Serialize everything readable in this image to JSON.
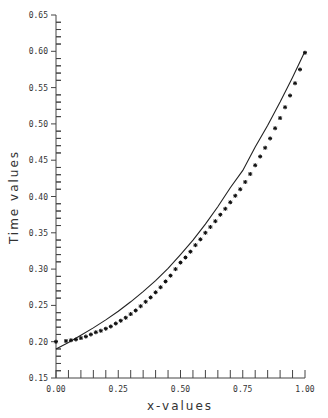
{
  "chart_data": {
    "type": "scatter",
    "title": "",
    "xlabel": "x-values",
    "ylabel": "Time values",
    "xlim": [
      0.0,
      1.0
    ],
    "ylim": [
      0.15,
      0.65
    ],
    "grid": false,
    "legend": null,
    "x_ticks": [
      "0.00",
      "0.25",
      "0.50",
      "0.75",
      "1.00"
    ],
    "y_ticks": [
      "0.15",
      "0.20",
      "0.25",
      "0.30",
      "0.35",
      "0.40",
      "0.45",
      "0.50",
      "0.55",
      "0.60",
      "0.65"
    ],
    "series": [
      {
        "name": "observed",
        "style": "markers",
        "marker": "asterisk",
        "x": [
          0.0,
          0.04,
          0.06,
          0.08,
          0.1,
          0.12,
          0.14,
          0.16,
          0.18,
          0.2,
          0.22,
          0.24,
          0.26,
          0.28,
          0.3,
          0.32,
          0.34,
          0.36,
          0.38,
          0.4,
          0.42,
          0.44,
          0.46,
          0.48,
          0.5,
          0.52,
          0.54,
          0.56,
          0.58,
          0.6,
          0.62,
          0.64,
          0.66,
          0.68,
          0.7,
          0.72,
          0.74,
          0.76,
          0.78,
          0.8,
          0.82,
          0.84,
          0.86,
          0.88,
          0.9,
          0.92,
          0.94,
          0.96,
          0.98,
          1.0
        ],
        "y": [
          0.2,
          0.201,
          0.202,
          0.203,
          0.205,
          0.207,
          0.21,
          0.213,
          0.215,
          0.218,
          0.221,
          0.225,
          0.229,
          0.233,
          0.238,
          0.243,
          0.249,
          0.255,
          0.261,
          0.268,
          0.275,
          0.283,
          0.291,
          0.3,
          0.309,
          0.316,
          0.324,
          0.333,
          0.341,
          0.35,
          0.358,
          0.366,
          0.375,
          0.383,
          0.392,
          0.401,
          0.41,
          0.42,
          0.431,
          0.443,
          0.455,
          0.467,
          0.48,
          0.494,
          0.508,
          0.523,
          0.539,
          0.556,
          0.575,
          0.598
        ]
      },
      {
        "name": "fitted",
        "style": "line",
        "x": [
          0.0,
          0.05,
          0.1,
          0.15,
          0.2,
          0.25,
          0.3,
          0.35,
          0.4,
          0.45,
          0.5,
          0.55,
          0.6,
          0.65,
          0.7,
          0.75,
          0.8,
          0.85,
          0.9,
          0.95,
          1.0
        ],
        "y": [
          0.19,
          0.199,
          0.209,
          0.219,
          0.23,
          0.242,
          0.255,
          0.269,
          0.284,
          0.301,
          0.32,
          0.34,
          0.362,
          0.386,
          0.412,
          0.436,
          0.468,
          0.498,
          0.53,
          0.564,
          0.6
        ]
      }
    ]
  },
  "axes": {
    "xlabel": "x-values",
    "ylabel": "Time values"
  }
}
